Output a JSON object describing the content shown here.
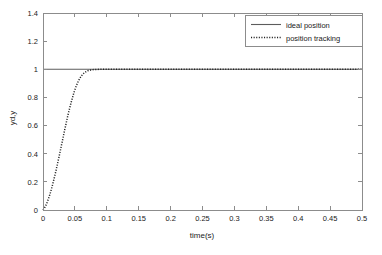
{
  "chart_data": {
    "type": "line",
    "title": "",
    "xlabel": "time(s)",
    "ylabel": "yd,y",
    "xlim": [
      0,
      0.5
    ],
    "ylim": [
      0,
      1.4
    ],
    "grid": false,
    "legend_position": "top-right",
    "xticks": [
      "0",
      "0.05",
      "0.1",
      "0.15",
      "0.2",
      "0.25",
      "0.3",
      "0.35",
      "0.4",
      "0.45",
      "0.5"
    ],
    "xtick_values": [
      0,
      0.05,
      0.1,
      0.15,
      0.2,
      0.25,
      0.3,
      0.35,
      0.4,
      0.45,
      0.5
    ],
    "yticks": [
      "0",
      "0.2",
      "0.4",
      "0.6",
      "0.8",
      "1",
      "1.2",
      "1.4"
    ],
    "ytick_values": [
      0,
      0.2,
      0.4,
      0.6,
      0.8,
      1,
      1.2,
      1.4
    ],
    "series": [
      {
        "name": "ideal position",
        "style": "solid",
        "color": "#5c5c5c",
        "x": [
          0,
          0.5
        ],
        "values": [
          1,
          1
        ]
      },
      {
        "name": "position tracking",
        "style": "dotted",
        "color": "#222222",
        "x": [
          0,
          0.002,
          0.004,
          0.006,
          0.008,
          0.01,
          0.012,
          0.014,
          0.016,
          0.018,
          0.02,
          0.022,
          0.024,
          0.026,
          0.028,
          0.03,
          0.032,
          0.034,
          0.036,
          0.038,
          0.04,
          0.042,
          0.044,
          0.046,
          0.048,
          0.05,
          0.052,
          0.054,
          0.056,
          0.058,
          0.06,
          0.062,
          0.064,
          0.066,
          0.068,
          0.07,
          0.075,
          0.08,
          0.09,
          0.1,
          0.15,
          0.2,
          0.25,
          0.3,
          0.35,
          0.4,
          0.45,
          0.5
        ],
        "values": [
          0,
          0.012,
          0.028,
          0.048,
          0.072,
          0.099,
          0.129,
          0.162,
          0.197,
          0.234,
          0.273,
          0.313,
          0.355,
          0.397,
          0.44,
          0.483,
          0.526,
          0.569,
          0.611,
          0.652,
          0.691,
          0.728,
          0.763,
          0.796,
          0.827,
          0.855,
          0.88,
          0.902,
          0.921,
          0.938,
          0.952,
          0.963,
          0.972,
          0.979,
          0.985,
          0.989,
          0.995,
          0.998,
          1.0,
          1.0,
          1.0,
          1.0,
          1.0,
          1.0,
          1.0,
          1.0,
          1.0,
          1.0
        ]
      }
    ]
  },
  "legend": {
    "entries": [
      {
        "label": "ideal position"
      },
      {
        "label": "position tracking"
      }
    ]
  },
  "axes": {
    "x_title": "time(s)",
    "y_title": "yd,y"
  }
}
